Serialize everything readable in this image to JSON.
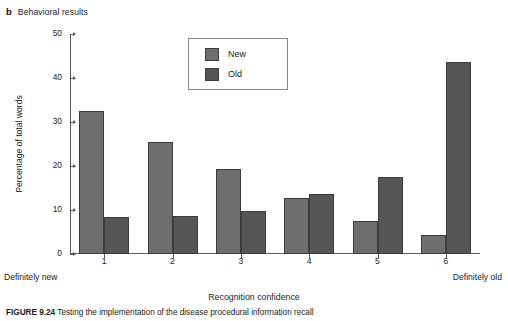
{
  "panel": {
    "letter": "b",
    "title": "Behavioral results"
  },
  "legend": {
    "items": [
      {
        "label": "New",
        "color": "#6e6e6e"
      },
      {
        "label": "Old",
        "color": "#565656"
      }
    ]
  },
  "axes": {
    "y_label": "Percentage of total words",
    "x_label": "Recognition confidence",
    "x_anchor_left": "Definitely new",
    "x_anchor_right": "Definitely old",
    "y_ticks": [
      "0",
      "10",
      "20",
      "30",
      "40",
      "50"
    ],
    "x_ticks": [
      "1",
      "2",
      "3",
      "4",
      "5",
      "6"
    ]
  },
  "caption": {
    "figure_number": "FIGURE 9.24",
    "text": "Testing the implementation of the disease procedural information recall"
  },
  "chart_data": {
    "type": "bar",
    "title": "Behavioral results",
    "xlabel": "Recognition confidence",
    "ylabel": "Percentage of total words",
    "categories": [
      "1",
      "2",
      "3",
      "4",
      "5",
      "6"
    ],
    "ylim": [
      0,
      50
    ],
    "ytick_step": 10,
    "grid": false,
    "legend_position": "top-center",
    "series": [
      {
        "name": "New",
        "color": "#6e6e6e",
        "values": [
          32.5,
          25.5,
          19.3,
          12.8,
          7.4,
          4.4
        ]
      },
      {
        "name": "Old",
        "color": "#565656",
        "values": [
          8.5,
          8.6,
          9.7,
          13.7,
          17.4,
          43.6
        ]
      }
    ],
    "annotations": {
      "x_left_anchor": "Definitely new",
      "x_right_anchor": "Definitely old"
    }
  }
}
